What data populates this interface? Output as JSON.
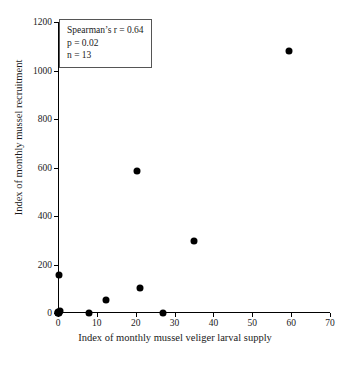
{
  "chart_data": {
    "type": "scatter",
    "title": "",
    "xlabel": "Index of monthly mussel veliger larval supply",
    "ylabel": "Index of monthly mussel recruitment",
    "xlim": [
      0,
      70
    ],
    "ylim": [
      0,
      1200
    ],
    "xticks": [
      0,
      10,
      20,
      30,
      40,
      50,
      60,
      70
    ],
    "yticks": [
      0,
      200,
      400,
      600,
      800,
      1000,
      1200
    ],
    "grid": false,
    "legend": "none",
    "marker_color": "#000000",
    "points": [
      {
        "x": 0.0,
        "y": 0
      },
      {
        "x": 0.0,
        "y": 0
      },
      {
        "x": 0.3,
        "y": 0
      },
      {
        "x": 0.6,
        "y": 8
      },
      {
        "x": 0.2,
        "y": 155
      },
      {
        "x": 8.0,
        "y": 0
      },
      {
        "x": 12.4,
        "y": 55
      },
      {
        "x": 20.3,
        "y": 585
      },
      {
        "x": 21.0,
        "y": 105
      },
      {
        "x": 27.0,
        "y": 0
      },
      {
        "x": 35.0,
        "y": 297
      },
      {
        "x": 59.5,
        "y": 1080
      },
      {
        "x": 0.0,
        "y": 5
      }
    ],
    "annotations": {
      "stats_box": {
        "line1": "Spearman’s r = 0.64",
        "line2": "p = 0.02",
        "line3": "n = 13"
      }
    }
  }
}
